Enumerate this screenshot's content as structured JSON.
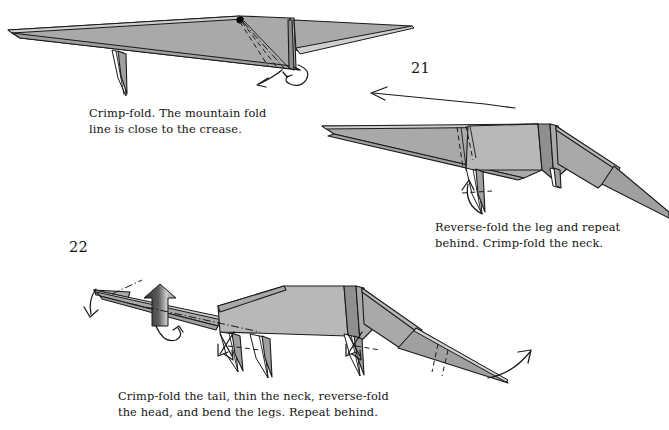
{
  "page": {
    "background_color": "#ffffff",
    "paper_fill_color": "#a9a9a9",
    "line_color": "#1a1a1a",
    "type": "origami-instruction-page"
  },
  "figures": [
    {
      "id": "figure-20-result",
      "step_number": "",
      "caption": "Crimp-fold. The mountain fold\nline is close to the crease.",
      "markings": [
        "black-reference-dot",
        "valley-fold-dashed-lines",
        "mountain-fold-dash-dot-line",
        "crimp-arrow",
        "repeat-behind-loop-arrow"
      ]
    },
    {
      "id": "figure-21-result",
      "step_number": "21",
      "caption": "Reverse-fold the leg and repeat\nbehind. Crimp-fold the neck.",
      "markings": [
        "neck-crimp-valley-lines",
        "leg-reverse-fold-arrow",
        "step-transition-arrow-left"
      ]
    },
    {
      "id": "figure-22-result",
      "step_number": "22",
      "caption": "Crimp-fold the tail, thin the neck, reverse-fold\nthe head, and bend the legs. Repeat behind.",
      "markings": [
        "head-reverse-fold-arrow",
        "push-here-solid-arrow",
        "neck-mountain-fold-line",
        "repeat-behind-loop-arrow",
        "leg-bend-arrows",
        "tail-crimp-valley-lines",
        "tail-crimp-arrow"
      ]
    }
  ],
  "labels": {
    "step_21": "21",
    "step_22": "22"
  },
  "captions": {
    "caption_1": "Crimp-fold. The mountain fold\nline is close to the crease.",
    "caption_2": "Reverse-fold the leg and repeat\nbehind. Crimp-fold the neck.",
    "caption_3": "Crimp-fold the tail, thin the neck, reverse-fold\nthe head, and bend the legs. Repeat behind."
  }
}
